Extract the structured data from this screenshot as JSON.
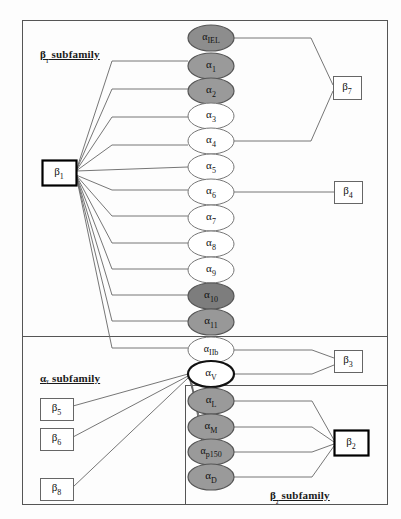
{
  "figure": {
    "title_hidden": "",
    "panels": [
      {
        "name": "beta1-panel",
        "label": "β₁ subfamily",
        "label_x": 40,
        "label_y": 48,
        "x": 22,
        "y": 20,
        "w": 365,
        "h": 316
      },
      {
        "name": "alphaV-panel",
        "label": "αᵛ subfamily",
        "label_x": 40,
        "label_y": 372,
        "x": 22,
        "y": 336,
        "w": 365,
        "h": 168
      },
      {
        "name": "beta2-panel",
        "label": "β₂ subfamily",
        "label_x": 270,
        "label_y": 489,
        "x": 185,
        "y": 385,
        "w": 202,
        "h": 119
      }
    ],
    "alpha_nodes": [
      {
        "id": "alpha-IEL",
        "label": "α",
        "sub": "IEL",
        "cx": 211,
        "cy": 38,
        "rx": 23,
        "ry": 13,
        "fill": "#8d8d8d",
        "stroke": "#555",
        "sw": 1.2
      },
      {
        "id": "alpha-1",
        "label": "α",
        "sub": "1",
        "cx": 211,
        "cy": 66,
        "rx": 23,
        "ry": 13,
        "fill": "#9a9a9a",
        "stroke": "#555",
        "sw": 1.2
      },
      {
        "id": "alpha-2",
        "label": "α",
        "sub": "2",
        "cx": 211,
        "cy": 91,
        "rx": 23,
        "ry": 13,
        "fill": "#9a9a9a",
        "stroke": "#555",
        "sw": 1.2
      },
      {
        "id": "alpha-3",
        "label": "α",
        "sub": "3",
        "cx": 211,
        "cy": 116,
        "rx": 23,
        "ry": 13,
        "fill": "#ffffff",
        "stroke": "#777",
        "sw": 1.0
      },
      {
        "id": "alpha-4",
        "label": "α",
        "sub": "4",
        "cx": 211,
        "cy": 141,
        "rx": 23,
        "ry": 13,
        "fill": "#ffffff",
        "stroke": "#777",
        "sw": 1.0
      },
      {
        "id": "alpha-5",
        "label": "α",
        "sub": "5",
        "cx": 211,
        "cy": 167,
        "rx": 23,
        "ry": 13,
        "fill": "#ffffff",
        "stroke": "#777",
        "sw": 1.0
      },
      {
        "id": "alpha-6",
        "label": "α",
        "sub": "6",
        "cx": 211,
        "cy": 192,
        "rx": 23,
        "ry": 13,
        "fill": "#ffffff",
        "stroke": "#777",
        "sw": 1.0
      },
      {
        "id": "alpha-7",
        "label": "α",
        "sub": "7",
        "cx": 211,
        "cy": 218,
        "rx": 23,
        "ry": 13,
        "fill": "#ffffff",
        "stroke": "#777",
        "sw": 1.0
      },
      {
        "id": "alpha-8",
        "label": "α",
        "sub": "8",
        "cx": 211,
        "cy": 244,
        "rx": 23,
        "ry": 13,
        "fill": "#ffffff",
        "stroke": "#777",
        "sw": 1.0
      },
      {
        "id": "alpha-9",
        "label": "α",
        "sub": "9",
        "cx": 211,
        "cy": 270,
        "rx": 23,
        "ry": 13,
        "fill": "#ffffff",
        "stroke": "#777",
        "sw": 1.0
      },
      {
        "id": "alpha-10",
        "label": "α",
        "sub": "10",
        "cx": 211,
        "cy": 296,
        "rx": 23,
        "ry": 13,
        "fill": "#7d7d7d",
        "stroke": "#555",
        "sw": 1.2
      },
      {
        "id": "alpha-11",
        "label": "α",
        "sub": "11",
        "cx": 211,
        "cy": 322,
        "rx": 23,
        "ry": 13,
        "fill": "#989898",
        "stroke": "#555",
        "sw": 1.2
      },
      {
        "id": "alpha-IIb",
        "label": "α",
        "sub": "IIb",
        "cx": 211,
        "cy": 350,
        "rx": 23,
        "ry": 13,
        "fill": "#ffffff",
        "stroke": "#777",
        "sw": 1.0
      },
      {
        "id": "alpha-V",
        "label": "α",
        "sub": "V",
        "cx": 211,
        "cy": 374,
        "rx": 23,
        "ry": 13,
        "fill": "#ffffff",
        "stroke": "#111",
        "sw": 2.2
      },
      {
        "id": "alpha-L",
        "label": "α",
        "sub": "L",
        "cx": 211,
        "cy": 401,
        "rx": 23,
        "ry": 13,
        "fill": "#9a9a9a",
        "stroke": "#555",
        "sw": 1.2
      },
      {
        "id": "alpha-M",
        "label": "α",
        "sub": "M",
        "cx": 211,
        "cy": 427,
        "rx": 23,
        "ry": 13,
        "fill": "#9a9a9a",
        "stroke": "#555",
        "sw": 1.2
      },
      {
        "id": "alpha-p150",
        "label": "α",
        "sub": "p150",
        "cx": 211,
        "cy": 452,
        "rx": 23,
        "ry": 13,
        "fill": "#9a9a9a",
        "stroke": "#555",
        "sw": 1.2
      },
      {
        "id": "alpha-D",
        "label": "α",
        "sub": "D",
        "cx": 211,
        "cy": 477,
        "rx": 23,
        "ry": 13,
        "fill": "#9a9a9a",
        "stroke": "#555",
        "sw": 1.2
      }
    ],
    "beta_nodes": [
      {
        "id": "beta-1",
        "label": "β",
        "sub": "1",
        "x": 42,
        "y": 160,
        "w": 34,
        "h": 25,
        "bold": true
      },
      {
        "id": "beta-7",
        "label": "β",
        "sub": "7",
        "x": 333,
        "y": 76,
        "w": 28,
        "h": 23,
        "bold": false
      },
      {
        "id": "beta-4",
        "label": "β",
        "sub": "4",
        "x": 334,
        "y": 181,
        "w": 28,
        "h": 22,
        "bold": false
      },
      {
        "id": "beta-3",
        "label": "β",
        "sub": "3",
        "x": 334,
        "y": 350,
        "w": 28,
        "h": 22,
        "bold": false
      },
      {
        "id": "beta-2",
        "label": "β",
        "sub": "2",
        "x": 334,
        "y": 430,
        "w": 34,
        "h": 25,
        "bold": true
      },
      {
        "id": "beta-5",
        "label": "β",
        "sub": "5",
        "x": 40,
        "y": 398,
        "w": 33,
        "h": 22,
        "bold": false
      },
      {
        "id": "beta-6",
        "label": "β",
        "sub": "6",
        "x": 40,
        "y": 428,
        "w": 33,
        "h": 22,
        "bold": false
      },
      {
        "id": "beta-8",
        "label": "β",
        "sub": "8",
        "x": 40,
        "y": 478,
        "w": 33,
        "h": 22,
        "bold": false
      }
    ],
    "edges": [
      {
        "id": "e-b1-a1",
        "from": "beta-1",
        "to": "alpha-1",
        "d": "M76,171 L112,61 L188,61"
      },
      {
        "id": "e-b1-a2",
        "from": "beta-1",
        "to": "alpha-2",
        "d": "M76,171 L112,89 L188,89"
      },
      {
        "id": "e-b1-a3",
        "from": "beta-1",
        "to": "alpha-3",
        "d": "M76,171 L112,117 L188,117"
      },
      {
        "id": "e-b1-a4",
        "from": "beta-1",
        "to": "alpha-4",
        "d": "M76,171 L112,145 L188,145"
      },
      {
        "id": "e-b1-a5",
        "from": "beta-1",
        "to": "alpha-5",
        "d": "M76,171 L188,167"
      },
      {
        "id": "e-b1-a6",
        "from": "beta-1",
        "to": "alpha-6",
        "d": "M76,175 L112,190 L188,190"
      },
      {
        "id": "e-b1-a7",
        "from": "beta-1",
        "to": "alpha-7",
        "d": "M76,175 L112,216 L188,216"
      },
      {
        "id": "e-b1-a8",
        "from": "beta-1",
        "to": "alpha-8",
        "d": "M76,175 L112,243 L188,243"
      },
      {
        "id": "e-b1-a9",
        "from": "beta-1",
        "to": "alpha-9",
        "d": "M76,175 L112,269 L188,269"
      },
      {
        "id": "e-b1-a10",
        "from": "beta-1",
        "to": "alpha-10",
        "d": "M76,175 L112,295 L188,295"
      },
      {
        "id": "e-b1-a11",
        "from": "beta-1",
        "to": "alpha-11",
        "d": "M76,175 L112,321 L188,321"
      },
      {
        "id": "e-b1-aIIb",
        "from": "beta-1",
        "to": "alpha-IIb",
        "d": "M76,175 L112,348 L188,348"
      },
      {
        "id": "e-aIEL-b7",
        "from": "alpha-IEL",
        "to": "beta-7",
        "d": "M234,38 L311,38 L333,85"
      },
      {
        "id": "e-a4-b7",
        "from": "alpha-4",
        "to": "beta-7",
        "d": "M234,141 L311,141 L333,91"
      },
      {
        "id": "e-a6-b4",
        "from": "alpha-6",
        "to": "beta-4",
        "d": "M234,192 L334,192"
      },
      {
        "id": "e-aIIb-b3",
        "from": "alpha-IIb",
        "to": "beta-3",
        "d": "M234,350 L312,350 L334,358"
      },
      {
        "id": "e-aV-b3",
        "from": "alpha-V",
        "to": "beta-3",
        "d": "M234,374 L312,374 L334,365"
      },
      {
        "id": "e-aV-b5",
        "from": "alpha-V",
        "to": "beta-5",
        "d": "M188,374 L73,406"
      },
      {
        "id": "e-aV-b6",
        "from": "alpha-V",
        "to": "beta-6",
        "d": "M188,376 L73,437"
      },
      {
        "id": "e-aV-b8",
        "from": "alpha-V",
        "to": "beta-8",
        "d": "M188,378 L73,487"
      },
      {
        "id": "e-aV-aL",
        "from": "alpha-V",
        "to": "alpha-L",
        "d": "M190,380 L196,401"
      },
      {
        "id": "e-aV-aM",
        "from": "alpha-V",
        "to": "alpha-M",
        "d": "M190,381 L202,427"
      },
      {
        "id": "e-aV-ap150",
        "from": "alpha-V",
        "to": "alpha-p150",
        "d": "M191,382 L206,452"
      },
      {
        "id": "e-aV-aD",
        "from": "alpha-V",
        "to": "alpha-D",
        "d": "M192,383 L208,477"
      },
      {
        "id": "e-aL-b2",
        "from": "alpha-L",
        "to": "beta-2",
        "d": "M234,401 L312,401 L334,440"
      },
      {
        "id": "e-aM-b2",
        "from": "alpha-M",
        "to": "beta-2",
        "d": "M234,427 L312,427 L334,442"
      },
      {
        "id": "e-ap150-b2",
        "from": "alpha-p150",
        "to": "beta-2",
        "d": "M234,452 L312,452 L334,444"
      },
      {
        "id": "e-aD-b2",
        "from": "alpha-D",
        "to": "beta-2",
        "d": "M234,477 L312,477 L334,446"
      }
    ],
    "colors": {
      "frame": "#555555",
      "edge": "#666666",
      "node_dark": "#8d8d8d",
      "node_mid": "#9a9a9a",
      "node_light": "#ffffff",
      "text": "#111111",
      "background": "#fdfdfd"
    }
  }
}
